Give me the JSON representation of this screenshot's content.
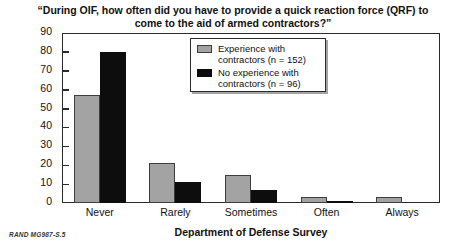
{
  "chart_data": {
    "type": "bar",
    "title": "“During OIF, how often did you have to provide a quick reaction force (QRF) to come to the aid of armed contractors?”",
    "xlabel": "Department of Defense Survey",
    "ylabel": "Percentage",
    "categories": [
      "Never",
      "Rarely",
      "Sometimes",
      "Often",
      "Always"
    ],
    "series": [
      {
        "name": "Experience with contractors (n = 152)",
        "color": "#a3a3a3",
        "values": [
          57,
          21,
          15,
          3,
          3
        ]
      },
      {
        "name": "No experience with contractors (n = 96)",
        "color": "#0d0d0d",
        "values": [
          80,
          11,
          7,
          1,
          0
        ]
      }
    ],
    "ylim": [
      0,
      90
    ],
    "yticks": [
      0,
      10,
      20,
      30,
      40,
      50,
      60,
      70,
      80,
      90
    ],
    "grid": false,
    "legend_position": "top-center"
  },
  "legend": {
    "entries": [
      {
        "label_line1": "Experience with",
        "label_line2": "contractors (n = 152)"
      },
      {
        "label_line1": "No experience with",
        "label_line2": "contractors (n = 96)"
      }
    ]
  },
  "footer": {
    "note": "RAND MG987-S.5"
  }
}
